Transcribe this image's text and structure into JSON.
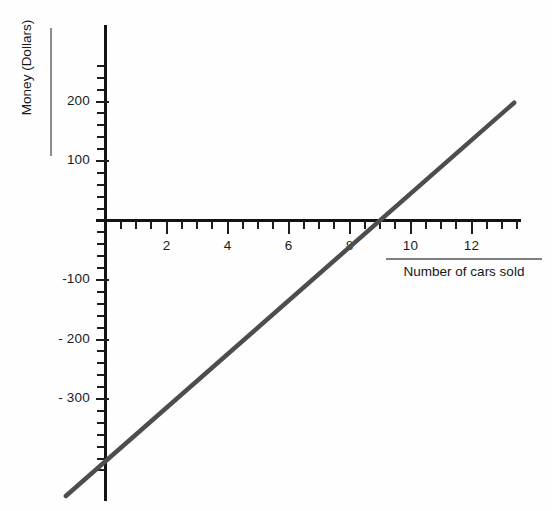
{
  "chart_data": {
    "type": "line",
    "title": "",
    "xlabel": "Number of cars sold",
    "ylabel": "Money (Dollars)",
    "xlim": [
      -1.4,
      13.6
    ],
    "ylim": [
      -445,
      270
    ],
    "grid": false,
    "legend": "none",
    "x_ticks_major": [
      2,
      4,
      6,
      8,
      10,
      12
    ],
    "x_tick_labels": [
      "2",
      "4",
      "6",
      "8",
      "10",
      "12"
    ],
    "x_tick_minor_step": 0.5,
    "y_ticks_major": [
      -300,
      -200,
      -100,
      100,
      200
    ],
    "y_tick_labels": [
      "- 300",
      "- 200",
      "-100",
      "100",
      "200"
    ],
    "y_tick_minor_step": 20,
    "series": [
      {
        "name": "Profit",
        "color": "#4d4d4d",
        "line_width": 4.5,
        "slope": 45,
        "intercept": -405,
        "x_intercept": 9,
        "x": [
          -1.3,
          13.4
        ],
        "values": [
          -463,
          198
        ]
      }
    ]
  },
  "axis_titles": {
    "y": "Money (Dollars)",
    "x": "Number of cars sold"
  },
  "colors": {
    "background": "#ffffff",
    "axis": "#131313",
    "line": "#4d4d4d",
    "text": "#1a1a1a",
    "rule": "#8d8d8d"
  }
}
